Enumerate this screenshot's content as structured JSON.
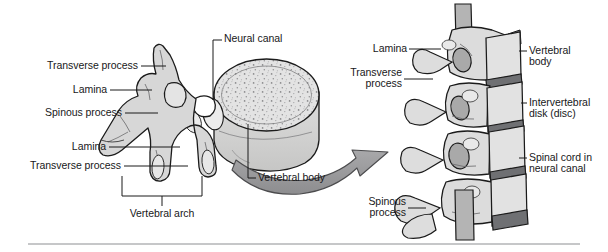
{
  "figure": {
    "background_color": "#ffffff",
    "rule_color": "#8d8f92",
    "bone_fill": "#d9d9d9",
    "bone_fill_light": "#e8e8e8",
    "bone_outline": "#1b1b1b",
    "disk_fill": "#6f7073",
    "arrow_fill": "#9a9a9c",
    "leader_color": "#1b1b1b",
    "text_color": "#18181a"
  },
  "left_panel": {
    "caption": "Single vertebra, superior oblique view",
    "labels": {
      "neural_canal": "Neural canal",
      "transverse_process_upper": "Transverse process",
      "lamina_upper": "Lamina",
      "spinous_process": "Spinous process",
      "lamina_lower": "Lamina",
      "transverse_process_lower": "Transverse process",
      "vertebral_body": "Vertebral body",
      "vertebral_arch": "Vertebral arch"
    }
  },
  "right_panel": {
    "caption": "Lateral view of several stacked vertebrae",
    "labels": {
      "lamina": "Lamina",
      "transverse_process_line1": "Transverse",
      "transverse_process_line2": "process",
      "spinous_process_line1": "Spinous",
      "spinous_process_line2": "process",
      "vertebral_body_line1": "Vertebral",
      "vertebral_body_line2": "body",
      "intervertebral_disk_line1": "Intervertebral",
      "intervertebral_disk_line2": "disk (disc)",
      "spinal_cord_line1": "Spinal cord in",
      "spinal_cord_line2": "neural canal"
    }
  },
  "annotations": {
    "arrow_name": "magnification-arrow",
    "arrow_direction": "left-to-right"
  }
}
